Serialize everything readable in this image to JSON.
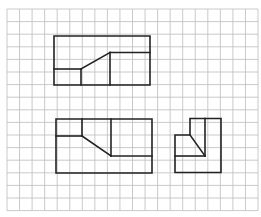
{
  "figure": {
    "background": "#ffffff",
    "grid": {
      "x0": 7,
      "y0": 9,
      "cols": 20,
      "rows": 16,
      "cell_w": 12.55,
      "cell_h": 12.6,
      "color": "#bdbdbd",
      "stroke_width": 0.8
    },
    "stroke": {
      "color": "#222222",
      "width": 1.6
    },
    "views": [
      {
        "name": "top-view",
        "outline": [
          [
            54,
            36
          ],
          [
            150,
            36
          ],
          [
            150,
            85
          ],
          [
            54,
            85
          ]
        ],
        "segments": [
          [
            [
              54,
              69
            ],
            [
              81,
              69
            ]
          ],
          [
            [
              81,
              69
            ],
            [
              81,
              85
            ]
          ],
          [
            [
              81,
              69
            ],
            [
              110,
              52.5
            ]
          ],
          [
            [
              110,
              52.5
            ],
            [
              150,
              52.5
            ]
          ],
          [
            [
              110,
              52.5
            ],
            [
              110,
              85
            ]
          ]
        ]
      },
      {
        "name": "front-view",
        "outline": [
          [
            56,
            119
          ],
          [
            152,
            119
          ],
          [
            152,
            173
          ],
          [
            56,
            173
          ]
        ],
        "segments": [
          [
            [
              56,
              136
            ],
            [
              82,
              136
            ]
          ],
          [
            [
              82,
              119
            ],
            [
              82,
              136
            ]
          ],
          [
            [
              82,
              136
            ],
            [
              111,
              156
            ]
          ],
          [
            [
              111,
              119
            ],
            [
              111,
              156
            ]
          ],
          [
            [
              111,
              156
            ],
            [
              152,
              156
            ]
          ]
        ]
      },
      {
        "name": "side-view",
        "outline": [
          [
            190,
            118.5
          ],
          [
            221,
            118.5
          ],
          [
            221,
            172.5
          ],
          [
            175,
            172.5
          ],
          [
            175,
            135
          ],
          [
            190,
            135
          ]
        ],
        "segments": [
          [
            [
              205,
              118.5
            ],
            [
              205,
              156
            ]
          ],
          [
            [
              190,
              135
            ],
            [
              205,
              156
            ]
          ],
          [
            [
              175,
              156
            ],
            [
              205,
              156
            ]
          ]
        ]
      }
    ]
  }
}
